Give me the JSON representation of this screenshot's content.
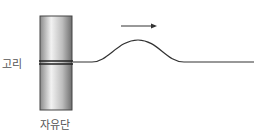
{
  "diagram": {
    "title": "",
    "labels": {
      "ring": "고리",
      "free_end": "자유단"
    },
    "arrow_direction": "right",
    "elements": [
      "pole",
      "ring",
      "string",
      "wave-pulse",
      "direction-arrow"
    ],
    "colors": {
      "line": "#333333",
      "label": "#555555",
      "pole_dark": "#6e6e6e",
      "pole_light": "#e8e8e8"
    }
  }
}
